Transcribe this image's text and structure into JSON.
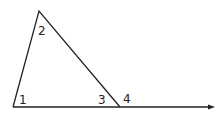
{
  "diagram": {
    "type": "triangle-exterior-angle",
    "angle_labels": {
      "a1": "1",
      "a2": "2",
      "a3": "3",
      "a4": "4"
    },
    "colors": {
      "line": "#222222",
      "background": "#ffffff"
    }
  }
}
